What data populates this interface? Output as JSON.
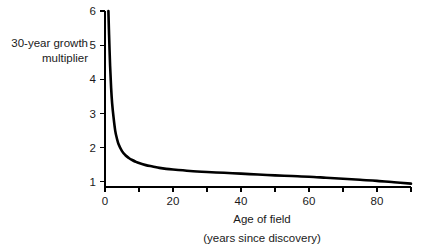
{
  "chart_data": {
    "type": "line",
    "title": "",
    "subtitle": "",
    "xlabel": "Age of field",
    "xlabel_sub": "(years since discovery)",
    "ylabel_line1": "30-year growth",
    "ylabel_line2": "multiplier",
    "xlim": [
      0,
      90
    ],
    "ylim": [
      0.85,
      6.0
    ],
    "grid": false,
    "legend": null,
    "line_color": "#000000",
    "axis_color": "#000000",
    "background": "#ffffff",
    "xticks": [
      0,
      10,
      20,
      30,
      40,
      50,
      60,
      70,
      80,
      90
    ],
    "xtick_labels": [
      "0",
      "",
      "20",
      "",
      "40",
      "",
      "60",
      "",
      "80",
      ""
    ],
    "yticks": [
      1,
      2,
      3,
      4,
      5,
      6
    ],
    "ytick_labels": [
      "1",
      "2",
      "3",
      "4",
      "5",
      "6"
    ],
    "x": [
      1.0,
      1.2,
      1.5,
      1.8,
      2.1,
      2.5,
      3.0,
      3.5,
      4.0,
      5.0,
      6.0,
      7.0,
      8.0,
      9.0,
      10.0,
      12.0,
      14.0,
      16.0,
      18.0,
      20.0,
      25.0,
      30.0,
      35.0,
      40.0,
      45.0,
      50.0,
      55.0,
      60.0,
      65.0,
      70.0,
      75.0,
      80.0,
      85.0,
      90.0
    ],
    "values": [
      6.0,
      5.3,
      4.4,
      3.75,
      3.3,
      2.9,
      2.5,
      2.27,
      2.1,
      1.9,
      1.78,
      1.7,
      1.64,
      1.59,
      1.55,
      1.49,
      1.45,
      1.41,
      1.38,
      1.36,
      1.32,
      1.29,
      1.265,
      1.24,
      1.215,
      1.19,
      1.17,
      1.15,
      1.12,
      1.09,
      1.06,
      1.03,
      0.99,
      0.95
    ],
    "series_name": "30-year growth multiplier vs age of field",
    "annotations": []
  }
}
